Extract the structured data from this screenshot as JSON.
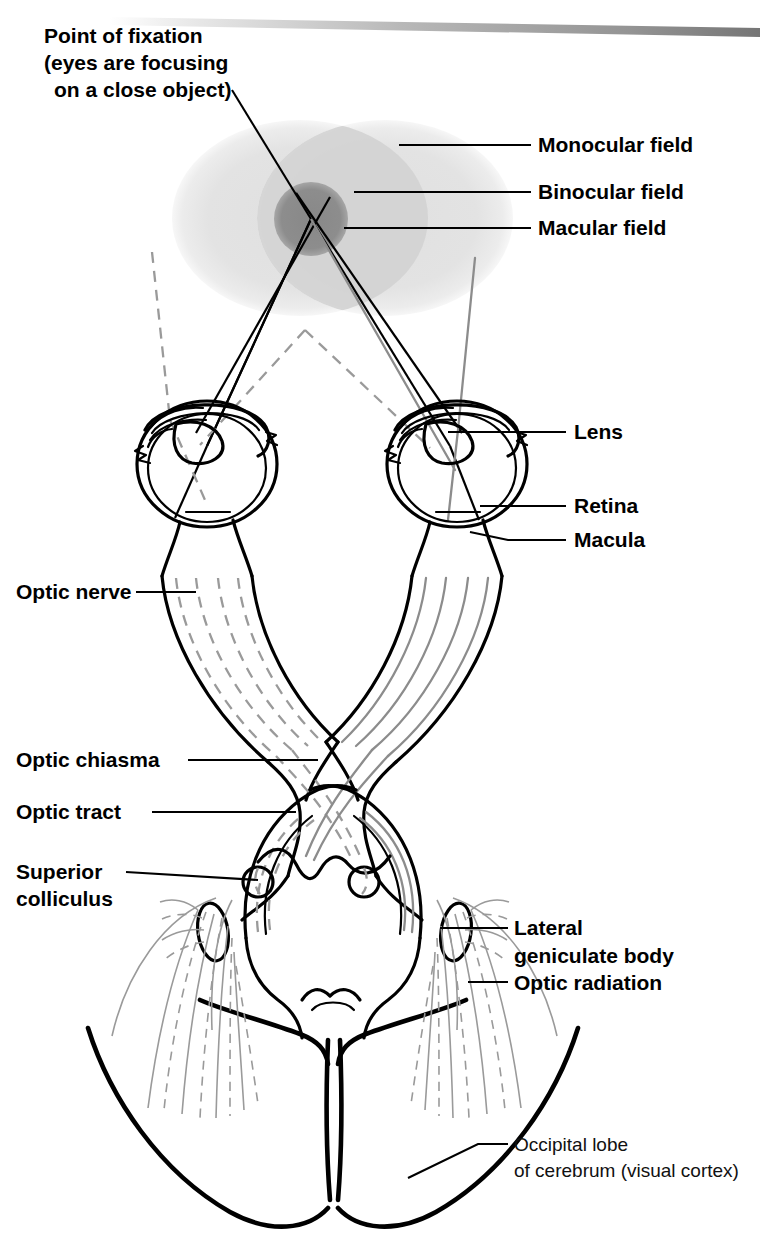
{
  "figure": {
    "domain_note": "anatomical line diagram"
  },
  "labels": {
    "point_of_fixation": {
      "line1": "Point of fixation",
      "line2": "(eyes are focusing",
      "line3": "on a close object)"
    },
    "monocular_field": "Monocular field",
    "binocular_field": "Binocular field",
    "macular_field": "Macular field",
    "lens": "Lens",
    "retina": "Retina",
    "macula": "Macula",
    "optic_nerve": "Optic nerve",
    "optic_chiasma": "Optic chiasma",
    "optic_tract": "Optic tract",
    "superior_colliculus": {
      "line1": "Superior",
      "line2": "colliculus"
    },
    "lateral_geniculate_body": {
      "line1": "Lateral",
      "line2": "geniculate body"
    },
    "optic_radiation": "Optic radiation",
    "occipital_lobe": {
      "line1": "Occipital lobe",
      "line2": "of cerebrum (visual cortex)"
    }
  },
  "colors": {
    "ink": "#000000",
    "monocular_field_fill": "#e2e2e2",
    "binocular_field_fill": "#d0d0d0",
    "macular_field_fill": "#8a8a8a",
    "fiber_gray": "#8c8c8c",
    "top_band": "#9a9a9a",
    "page_background": "#ffffff"
  }
}
